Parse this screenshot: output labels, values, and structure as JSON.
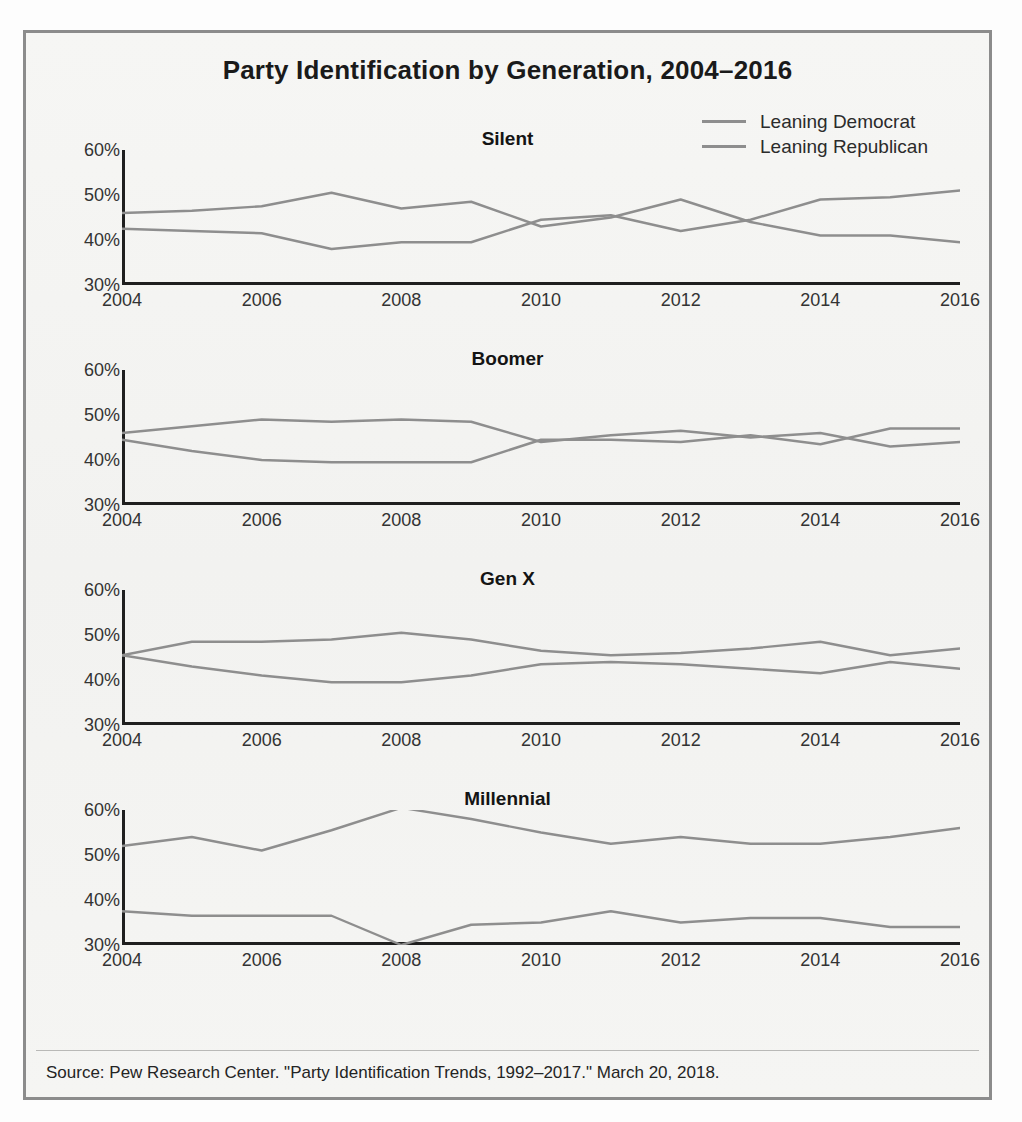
{
  "figure": {
    "title": "Party Identification by Generation, 2004–2016",
    "source_note": "Source: Pew Research Center. \"Party Identification Trends, 1992–2017.\" March 20, 2018."
  },
  "legend": {
    "position": "top-right",
    "entries": [
      {
        "label": "Leaning Democrat",
        "color": "#8e8e8e"
      },
      {
        "label": "Leaning Republican",
        "color": "#8e8e8e"
      }
    ]
  },
  "axis": {
    "y_ticks": [
      "60%",
      "50%",
      "40%",
      "30%"
    ],
    "y_values": [
      60,
      50,
      40,
      30
    ],
    "x_ticks": [
      "2004",
      "2006",
      "2008",
      "2010",
      "2012",
      "2014",
      "2016"
    ],
    "x_tick_values": [
      2004,
      2006,
      2008,
      2010,
      2012,
      2014,
      2016
    ],
    "ylim": [
      30,
      60
    ],
    "xlim": [
      2004,
      2016
    ],
    "grid": false
  },
  "chart_data": [
    {
      "type": "line",
      "title": "Silent",
      "xlabel": "",
      "ylabel": "",
      "ylim": [
        30,
        60
      ],
      "xlim": [
        2004,
        2016
      ],
      "grid": false,
      "legend_position": "top-right",
      "x": [
        2004,
        2005,
        2006,
        2007,
        2008,
        2009,
        2010,
        2011,
        2012,
        2013,
        2014,
        2015,
        2016
      ],
      "series": [
        {
          "name": "Leaning Democrat",
          "color": "#8e8e8e",
          "values": [
            46,
            46.5,
            47.5,
            50.5,
            47,
            48.5,
            43,
            45,
            49,
            44,
            41,
            41,
            39.5
          ]
        },
        {
          "name": "Leaning Republican",
          "color": "#8e8e8e",
          "values": [
            42.5,
            42,
            41.5,
            38,
            39.5,
            39.5,
            44.5,
            45.5,
            42,
            44.5,
            49,
            49.5,
            51
          ]
        }
      ]
    },
    {
      "type": "line",
      "title": "Boomer",
      "xlabel": "",
      "ylabel": "",
      "ylim": [
        30,
        60
      ],
      "xlim": [
        2004,
        2016
      ],
      "grid": false,
      "legend_position": "top-right",
      "x": [
        2004,
        2005,
        2006,
        2007,
        2008,
        2009,
        2010,
        2011,
        2012,
        2013,
        2014,
        2015,
        2016
      ],
      "series": [
        {
          "name": "Leaning Democrat",
          "color": "#8e8e8e",
          "values": [
            46,
            47.5,
            49,
            48.5,
            49,
            48.5,
            44,
            45.5,
            46.5,
            45,
            46,
            43,
            44
          ]
        },
        {
          "name": "Leaning Republican",
          "color": "#8e8e8e",
          "values": [
            44.5,
            42,
            40,
            39.5,
            39.5,
            39.5,
            44.5,
            44.5,
            44,
            45.5,
            43.5,
            47,
            47
          ]
        }
      ]
    },
    {
      "type": "line",
      "title": "Gen X",
      "xlabel": "",
      "ylabel": "",
      "ylim": [
        30,
        60
      ],
      "xlim": [
        2004,
        2016
      ],
      "grid": false,
      "legend_position": "top-right",
      "x": [
        2004,
        2005,
        2006,
        2007,
        2008,
        2009,
        2010,
        2011,
        2012,
        2013,
        2014,
        2015,
        2016
      ],
      "series": [
        {
          "name": "Leaning Democrat",
          "color": "#8e8e8e",
          "values": [
            45.5,
            48.5,
            48.5,
            49,
            50.5,
            49,
            46.5,
            45.5,
            46,
            47,
            48.5,
            45.5,
            47
          ]
        },
        {
          "name": "Leaning Republican",
          "color": "#8e8e8e",
          "values": [
            45.5,
            43,
            41,
            39.5,
            39.5,
            41,
            43.5,
            44,
            43.5,
            42.5,
            41.5,
            44,
            42.5
          ]
        }
      ]
    },
    {
      "type": "line",
      "title": "Millennial",
      "xlabel": "",
      "ylabel": "",
      "ylim": [
        30,
        60
      ],
      "xlim": [
        2004,
        2016
      ],
      "grid": false,
      "legend_position": "top-right",
      "x": [
        2004,
        2005,
        2006,
        2007,
        2008,
        2009,
        2010,
        2011,
        2012,
        2013,
        2014,
        2015,
        2016
      ],
      "series": [
        {
          "name": "Leaning Democrat",
          "color": "#8e8e8e",
          "values": [
            52,
            54,
            51,
            55.5,
            60.5,
            58,
            55,
            52.5,
            54,
            52.5,
            52.5,
            54,
            56
          ]
        },
        {
          "name": "Leaning Republican",
          "color": "#8e8e8e",
          "values": [
            37.5,
            36.5,
            36.5,
            36.5,
            30,
            34.5,
            35,
            37.5,
            35,
            36,
            36,
            34,
            34
          ]
        }
      ]
    }
  ]
}
